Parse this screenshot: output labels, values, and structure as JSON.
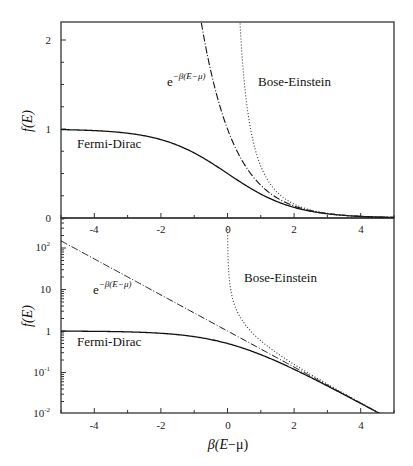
{
  "chart_data": [
    {
      "type": "line",
      "panel": "top",
      "title": "",
      "xlabel": "",
      "ylabel": "f(E)",
      "xlim": [
        -5,
        5
      ],
      "ylim": [
        0,
        2.2
      ],
      "yscale": "linear",
      "x_ticks": [
        -4,
        -2,
        0,
        2,
        4
      ],
      "y_ticks": [
        0,
        1,
        2
      ],
      "grid": false,
      "legend": "none (inline annotations)",
      "series": [
        {
          "name": "Fermi-Dirac",
          "style": "solid",
          "formula": "1/(exp(x)+1)",
          "x": [
            -5,
            -4,
            -3,
            -2,
            -1,
            0,
            1,
            2,
            3,
            4,
            5
          ],
          "values": [
            0.993,
            0.982,
            0.953,
            0.881,
            0.731,
            0.5,
            0.269,
            0.119,
            0.047,
            0.018,
            0.007
          ]
        },
        {
          "name": "e^{-β(E-μ)}",
          "style": "dashed",
          "formula": "exp(-x)",
          "x": [
            -0.8,
            -0.5,
            0,
            0.5,
            1,
            2,
            3,
            4,
            5
          ],
          "values": [
            2.23,
            1.65,
            1.0,
            0.607,
            0.368,
            0.135,
            0.05,
            0.018,
            0.007
          ]
        },
        {
          "name": "Bose-Einstein",
          "style": "dotted",
          "formula": "1/(exp(x)-1)",
          "x": [
            0.38,
            0.5,
            1,
            1.5,
            2,
            3,
            4,
            5
          ],
          "values": [
            2.2,
            1.54,
            0.582,
            0.287,
            0.157,
            0.052,
            0.019,
            0.007
          ]
        }
      ],
      "annotations": [
        "e^{-β(E-μ)}",
        "Bose-Einstein",
        "Fermi-Dirac"
      ]
    },
    {
      "type": "line",
      "panel": "bottom",
      "title": "",
      "xlabel": "β(E−μ)",
      "ylabel": "f(E)",
      "xlim": [
        -5,
        5
      ],
      "ylim": [
        0.01,
        300
      ],
      "yscale": "log",
      "x_ticks": [
        -4,
        -2,
        0,
        2,
        4
      ],
      "y_ticks": [
        "10^-2",
        "10^-1",
        "1",
        "10",
        "10^2"
      ],
      "grid": false,
      "legend": "none (inline annotations)",
      "series": [
        {
          "name": "Fermi-Dirac",
          "style": "solid",
          "formula": "1/(exp(x)+1)",
          "x": [
            -5,
            -4,
            -3,
            -2,
            -1,
            0,
            1,
            2,
            3,
            4,
            4.6
          ],
          "values": [
            0.993,
            0.982,
            0.953,
            0.881,
            0.731,
            0.5,
            0.269,
            0.119,
            0.047,
            0.018,
            0.01
          ]
        },
        {
          "name": "e^{-β(E-μ)}",
          "style": "dashed",
          "formula": "exp(-x)",
          "x": [
            -5,
            -4,
            -3,
            -2,
            -1,
            0,
            1,
            2,
            3,
            4,
            4.6
          ],
          "values": [
            148.4,
            54.6,
            20.1,
            7.39,
            2.72,
            1.0,
            0.368,
            0.135,
            0.05,
            0.018,
            0.01
          ]
        },
        {
          "name": "Bose-Einstein",
          "style": "dotted",
          "formula": "1/(exp(x)-1)",
          "x": [
            0.005,
            0.05,
            0.2,
            0.5,
            1,
            2,
            3,
            4,
            4.6
          ],
          "values": [
            200,
            19.5,
            4.52,
            1.54,
            0.582,
            0.157,
            0.052,
            0.019,
            0.01
          ]
        }
      ],
      "annotations": [
        "e^{-β(E-μ)}",
        "Bose-Einstein",
        "Fermi-Dirac"
      ]
    }
  ],
  "labels": {
    "ylabel": "f(E)",
    "xlabel_prefix": "β(",
    "xlabel_E": "E",
    "xlabel_suffix": "−μ)",
    "fermi_dirac": "Fermi-Dirac",
    "bose_einstein": "Bose-Einstein",
    "boltzmann_base": "e",
    "boltzmann_exp": "−β(E−μ)",
    "top_yticks": [
      "0",
      "1",
      "2"
    ],
    "xticks": [
      "-4",
      "-2",
      "0",
      "2",
      "4"
    ],
    "log_one": "1",
    "log_ten": "10",
    "log_base": "10",
    "log_exp_2": "2",
    "log_exp_m1": "-1",
    "log_exp_m2": "-2"
  },
  "colors": {
    "line": "#111111",
    "frame": "#333333",
    "background": "#ffffff"
  }
}
